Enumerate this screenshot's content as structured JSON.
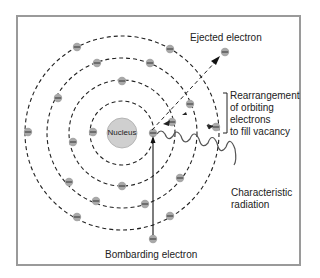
{
  "diagram": {
    "type": "atomic-model",
    "nucleus_label": "Nucleus",
    "labels": {
      "ejected": "Ejected electron",
      "rearrangement": [
        "Rearrangement",
        "of orbiting",
        "electrons",
        "to fill vacancy"
      ],
      "characteristic": [
        "Characteristic",
        "radiation"
      ],
      "bombarding": "Bombarding electron"
    },
    "colors": {
      "electron": "#a8a8a8",
      "nucleus": "#cfcfcf",
      "orbit": "#222222",
      "frame": "#9a9a9a"
    }
  }
}
